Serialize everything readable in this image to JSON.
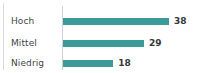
{
  "chart_data": {
    "type": "bar",
    "orientation": "horizontal",
    "title": "",
    "subtitle": "",
    "xlabel": "",
    "ylabel": "",
    "categories": [
      "Hoch",
      "Mittel",
      "Niedrig"
    ],
    "values": [
      38,
      29,
      18
    ],
    "value_labels": [
      "38",
      "29",
      "18"
    ],
    "series": [
      {
        "name": "",
        "values": [
          38,
          29,
          18
        ]
      }
    ],
    "xlim": [
      0,
      38
    ],
    "grid": false,
    "legend": false,
    "legend_position": "none",
    "axis_line": true,
    "bars": [
      {
        "category": "Hoch",
        "value": 38,
        "label": "38",
        "pct": 100.0
      },
      {
        "category": "Mittel",
        "value": 29,
        "label": "29",
        "pct": 76.3
      },
      {
        "category": "Niedrig",
        "value": 18,
        "label": "18",
        "pct": 47.4
      }
    ]
  },
  "colors": {
    "bar": "#3a9b99",
    "value_text": "#32383b",
    "category_text": "#3f4447",
    "axis_line": "#d0d3d4",
    "panel_rule": "#d8dadb",
    "background": "#ffffff"
  }
}
